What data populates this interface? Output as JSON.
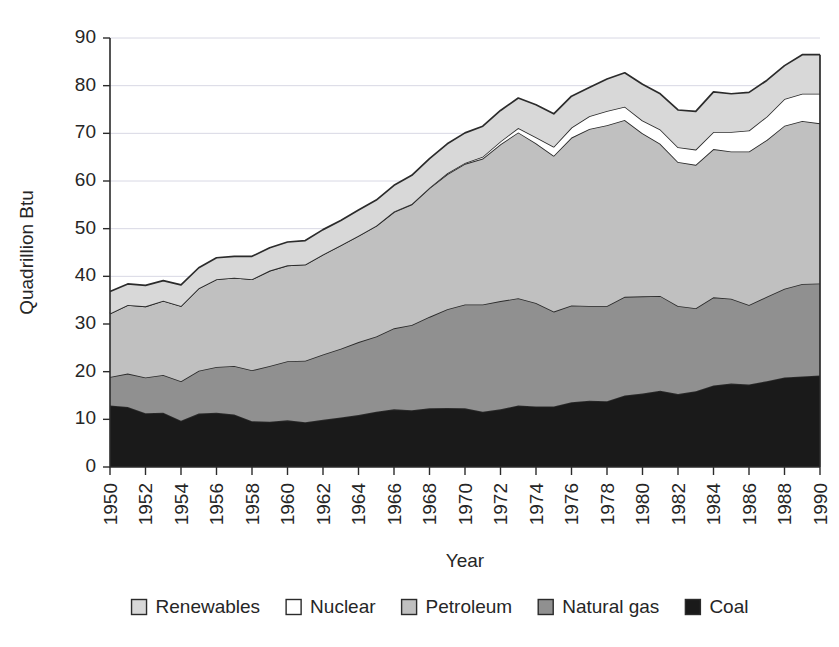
{
  "chart_data": {
    "type": "area",
    "stacked": true,
    "title": "",
    "xlabel": "Year",
    "ylabel": "Quadrillion Btu",
    "xlim": [
      1950,
      1990
    ],
    "ylim": [
      0,
      90
    ],
    "ytick_step": 10,
    "xtick_step": 2,
    "grid": true,
    "grid_axis": "y",
    "legend_position": "bottom",
    "x": [
      1950,
      1951,
      1952,
      1953,
      1954,
      1955,
      1956,
      1957,
      1958,
      1959,
      1960,
      1961,
      1962,
      1963,
      1964,
      1965,
      1966,
      1967,
      1968,
      1969,
      1970,
      1971,
      1972,
      1973,
      1974,
      1975,
      1976,
      1977,
      1978,
      1979,
      1980,
      1981,
      1982,
      1983,
      1984,
      1985,
      1986,
      1987,
      1988,
      1989,
      1990
    ],
    "xtick_labels": [
      "1950",
      "1952",
      "1954",
      "1956",
      "1958",
      "1960",
      "1962",
      "1964",
      "1966",
      "1968",
      "1970",
      "1972",
      "1974",
      "1976",
      "1978",
      "1980",
      "1982",
      "1984",
      "1986",
      "1988",
      "1990"
    ],
    "ytick_labels": [
      "0",
      "10",
      "20",
      "30",
      "40",
      "50",
      "60",
      "70",
      "80",
      "90"
    ],
    "series": [
      {
        "name": "Coal",
        "color": "#1a1a1a",
        "values": [
          12.9,
          12.6,
          11.3,
          11.4,
          9.7,
          11.2,
          11.4,
          11.0,
          9.6,
          9.5,
          9.8,
          9.4,
          9.9,
          10.4,
          10.9,
          11.6,
          12.1,
          11.9,
          12.3,
          12.4,
          12.3,
          11.6,
          12.1,
          12.9,
          12.7,
          12.7,
          13.6,
          13.9,
          13.8,
          15.0,
          15.4,
          16.0,
          15.3,
          15.9,
          17.1,
          17.5,
          17.3,
          18.0,
          18.8,
          19.0,
          19.2
        ]
      },
      {
        "name": "Natural gas",
        "color": "#909090",
        "values": [
          6.0,
          7.0,
          7.5,
          7.9,
          8.3,
          9.0,
          9.6,
          10.2,
          10.7,
          11.7,
          12.4,
          12.9,
          13.7,
          14.4,
          15.3,
          15.8,
          17.0,
          17.9,
          19.2,
          20.7,
          21.8,
          22.5,
          22.7,
          22.5,
          21.7,
          19.9,
          20.3,
          19.9,
          20.0,
          20.7,
          20.4,
          19.9,
          18.5,
          17.4,
          18.5,
          17.8,
          16.7,
          17.7,
          18.6,
          19.4,
          19.3
        ]
      },
      {
        "name": "Petroleum",
        "color": "#c0c0c0",
        "values": [
          13.3,
          14.4,
          14.9,
          15.6,
          15.8,
          17.3,
          18.4,
          18.5,
          19.1,
          20.0,
          20.1,
          20.2,
          21.0,
          21.7,
          22.3,
          23.2,
          24.4,
          25.3,
          27.0,
          28.3,
          29.5,
          30.6,
          32.9,
          34.8,
          33.5,
          32.7,
          35.2,
          37.1,
          37.9,
          37.1,
          34.2,
          31.9,
          30.2,
          30.1,
          31.1,
          30.9,
          32.2,
          32.9,
          34.2,
          34.2,
          33.6
        ]
      },
      {
        "name": "Nuclear",
        "color": "#ffffff",
        "values": [
          0.0,
          0.0,
          0.0,
          0.0,
          0.0,
          0.0,
          0.0,
          0.0,
          0.0,
          0.0,
          0.0,
          0.0,
          0.0,
          0.0,
          0.0,
          0.0,
          0.1,
          0.1,
          0.1,
          0.2,
          0.2,
          0.4,
          0.6,
          0.9,
          1.3,
          1.9,
          2.1,
          2.7,
          3.0,
          2.8,
          2.7,
          3.0,
          3.1,
          3.2,
          3.6,
          4.1,
          4.4,
          4.9,
          5.6,
          5.7,
          6.2
        ]
      },
      {
        "name": "Renewables",
        "color": "#d8d8d8",
        "values": [
          4.6,
          4.4,
          4.4,
          4.2,
          4.4,
          4.3,
          4.5,
          4.5,
          4.8,
          4.8,
          4.9,
          5.0,
          5.2,
          5.2,
          5.4,
          5.4,
          5.5,
          6.0,
          6.1,
          6.2,
          6.3,
          6.4,
          6.5,
          6.3,
          6.8,
          6.9,
          6.6,
          6.0,
          6.7,
          7.1,
          7.6,
          7.5,
          7.8,
          8.0,
          8.4,
          8.0,
          8.0,
          7.6,
          7.0,
          8.2,
          8.2
        ]
      }
    ],
    "legend": [
      {
        "label": "Renewables",
        "color": "#d8d8d8"
      },
      {
        "label": "Nuclear",
        "color": "#ffffff"
      },
      {
        "label": "Petroleum",
        "color": "#c0c0c0"
      },
      {
        "label": "Natural gas",
        "color": "#909090"
      },
      {
        "label": "Coal",
        "color": "#1a1a1a"
      }
    ]
  }
}
